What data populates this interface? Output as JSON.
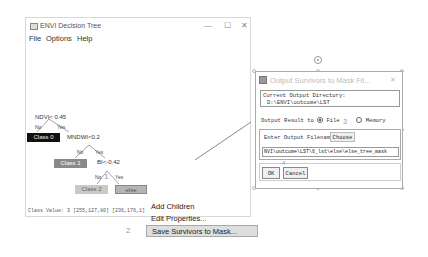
{
  "main_window": {
    "title": "ENVI Decision Tree",
    "controls": {
      "minimize": "—",
      "maximize": "☐",
      "close": "✕"
    },
    "menu": [
      "File",
      "Options",
      "Help"
    ],
    "tree": {
      "root": "NDVI< 0.45",
      "root_no": "No",
      "root_yes": "Yes",
      "class0": "Class 0",
      "node2": "MNDWI<0.2",
      "node2_no": "No",
      "node2_yes": "Yes",
      "class1": "Class 1",
      "node3": "BI<-0.42",
      "node3_no": "No",
      "node3_yes": "Yes",
      "class2": "Class 2",
      "else": "else"
    },
    "status": "Class Value: 3 [255,127,80] [236,176,1]"
  },
  "context_menu": {
    "items": [
      "Add Children",
      "Edit Properties...",
      "Save Survivors to Mask..."
    ],
    "selected_index": 2
  },
  "steps": {
    "s1": "1",
    "s2": "2",
    "s3": "3",
    "s4": "4"
  },
  "dialog": {
    "title": "Output Survivors to Mask Fil...",
    "close": "✕",
    "current_dir_label": "Current Output Directory:",
    "current_dir_value": "D:\\ENVI\\outcome\\LST",
    "output_result_label": "Output Result to",
    "option_file": "File",
    "option_memory": "Memory",
    "selected_option": "File",
    "filename_label": "Enter Output Filename",
    "choose_button": "Choose",
    "filename_value": "NVI\\outcome\\LST\\6_lst\\else\\else_tree_mask",
    "ok_button": "OK",
    "cancel_button": "Cancel"
  }
}
